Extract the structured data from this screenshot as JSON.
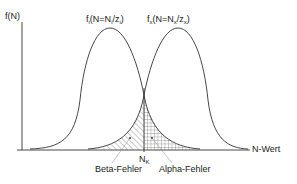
{
  "diagram": {
    "y_axis_label": "f(N)",
    "x_axis_label": "N-Wert",
    "curve_left": {
      "label_prefix": "f",
      "label_sub": "i",
      "label_mid": "(N=N",
      "label_sub2": "i",
      "label_mid2": "/z",
      "label_sub3": "i",
      "label_end": ")"
    },
    "curve_right": {
      "label_prefix": "f",
      "label_sub": "x",
      "label_mid": "(N=N",
      "label_sub2": "x",
      "label_mid2": "/z",
      "label_sub3": "x",
      "label_end": ")"
    },
    "threshold": {
      "label": "N",
      "label_sub": "K"
    },
    "beta_error_label": "Beta-Fehler",
    "alpha_error_label": "Alpha-Fehler",
    "colors": {
      "line": "#333333",
      "background": "#ffffff"
    }
  }
}
